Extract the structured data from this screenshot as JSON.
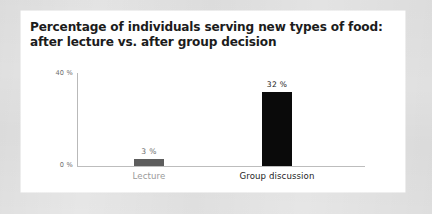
{
  "slide": {
    "title_line_1": "Percentage of individuals serving new types of food:",
    "title_line_2": "after lecture vs. after group decision",
    "background_color": "#e7e7e7",
    "card_color": "#ffffff"
  },
  "chart_data": {
    "type": "bar",
    "title": "Percentage of individuals serving new types of food: after lecture vs. after group decision",
    "categories": [
      "Lecture",
      "Group discussion"
    ],
    "values": [
      3,
      32
    ],
    "value_labels": [
      "3 %",
      "32 %"
    ],
    "bar_colors": [
      "#5d5d5d",
      "#0a0a0a"
    ],
    "category_label_colors": [
      "#9a9a9a",
      "#242424"
    ],
    "xlabel": "",
    "ylabel": "",
    "ylim": [
      0,
      40
    ],
    "y_tick_labels": [
      "0 %",
      "40 %"
    ],
    "y_tick_top": "40 %",
    "y_tick_zero": "0 %",
    "grid": false,
    "legend": false,
    "axis_color": "#bdbdbd"
  }
}
